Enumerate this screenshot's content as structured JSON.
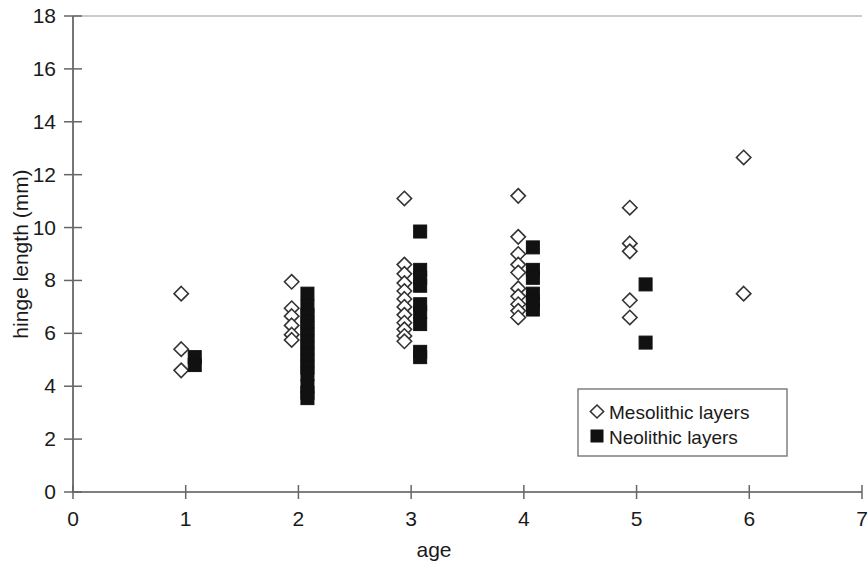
{
  "chart_data": {
    "type": "scatter",
    "title": "",
    "xlabel": "age",
    "ylabel": "hinge length (mm)",
    "xlim": [
      0,
      7
    ],
    "ylim": [
      0,
      18
    ],
    "xticks": [
      0,
      1,
      2,
      3,
      4,
      5,
      6,
      7
    ],
    "yticks": [
      0,
      2,
      4,
      6,
      8,
      10,
      12,
      14,
      16,
      18
    ],
    "xtick_labels": [
      "0",
      "1",
      "2",
      "3",
      "4",
      "5",
      "6",
      "7"
    ],
    "ytick_labels": [
      "0",
      "2",
      "4",
      "6",
      "8",
      "10",
      "12",
      "14",
      "16",
      "18"
    ],
    "grid": false,
    "legend_position": "inside-lower-right",
    "series": [
      {
        "name": "Mesolithic layers",
        "marker": "open-diamond",
        "color": "#ffffff",
        "edge_color": "#333333",
        "points": [
          [
            0.96,
            7.5
          ],
          [
            0.96,
            5.4
          ],
          [
            0.96,
            4.6
          ],
          [
            1.94,
            7.95
          ],
          [
            1.94,
            6.95
          ],
          [
            1.94,
            6.65
          ],
          [
            1.94,
            6.3
          ],
          [
            1.94,
            5.95
          ],
          [
            1.94,
            5.75
          ],
          [
            2.94,
            11.1
          ],
          [
            2.94,
            8.6
          ],
          [
            2.94,
            8.25
          ],
          [
            2.94,
            7.9
          ],
          [
            2.94,
            7.6
          ],
          [
            2.94,
            7.3
          ],
          [
            2.94,
            7.0
          ],
          [
            2.94,
            6.7
          ],
          [
            2.94,
            6.4
          ],
          [
            2.94,
            6.15
          ],
          [
            2.94,
            5.9
          ],
          [
            2.94,
            5.7
          ],
          [
            3.95,
            11.2
          ],
          [
            3.95,
            9.65
          ],
          [
            3.95,
            9.0
          ],
          [
            3.95,
            8.6
          ],
          [
            3.95,
            8.3
          ],
          [
            3.95,
            7.7
          ],
          [
            3.95,
            7.4
          ],
          [
            3.95,
            7.1
          ],
          [
            3.95,
            6.85
          ],
          [
            3.95,
            6.6
          ],
          [
            4.94,
            10.75
          ],
          [
            4.94,
            9.4
          ],
          [
            4.94,
            9.1
          ],
          [
            4.94,
            7.25
          ],
          [
            4.94,
            6.6
          ],
          [
            5.95,
            12.65
          ],
          [
            5.95,
            7.5
          ]
        ]
      },
      {
        "name": "Neolithic layers",
        "marker": "filled-square",
        "color": "#111111",
        "edge_color": "#111111",
        "points": [
          [
            1.08,
            5.1
          ],
          [
            1.08,
            4.8
          ],
          [
            2.08,
            7.5
          ],
          [
            2.08,
            7.0
          ],
          [
            2.08,
            6.7
          ],
          [
            2.08,
            6.45
          ],
          [
            2.08,
            6.2
          ],
          [
            2.08,
            5.95
          ],
          [
            2.08,
            5.7
          ],
          [
            2.08,
            5.45
          ],
          [
            2.08,
            5.2
          ],
          [
            2.08,
            4.95
          ],
          [
            2.08,
            4.7
          ],
          [
            2.08,
            4.45
          ],
          [
            2.08,
            4.0
          ],
          [
            2.08,
            3.75
          ],
          [
            2.08,
            3.55
          ],
          [
            3.08,
            9.85
          ],
          [
            3.08,
            8.4
          ],
          [
            3.08,
            8.1
          ],
          [
            3.08,
            7.8
          ],
          [
            3.08,
            7.1
          ],
          [
            3.08,
            6.8
          ],
          [
            3.08,
            6.35
          ],
          [
            3.08,
            5.3
          ],
          [
            3.08,
            5.1
          ],
          [
            4.08,
            9.25
          ],
          [
            4.08,
            8.4
          ],
          [
            4.08,
            8.1
          ],
          [
            4.08,
            7.5
          ],
          [
            4.08,
            7.2
          ],
          [
            4.08,
            6.9
          ],
          [
            5.08,
            7.85
          ],
          [
            5.08,
            5.65
          ]
        ]
      }
    ],
    "legend_entries": [
      {
        "label": "Mesolithic layers",
        "marker": "open-diamond"
      },
      {
        "label": "Neolithic layers",
        "marker": "filled-square"
      }
    ]
  }
}
